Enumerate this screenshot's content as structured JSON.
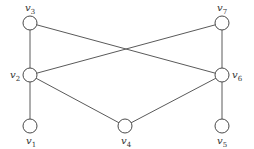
{
  "diagram": {
    "type": "undirected-graph",
    "colors": {
      "edge": "#5a5a5a",
      "node_stroke": "#4a4a4a",
      "node_fill": "#ffffff",
      "label": "#333333"
    },
    "node_radius": 7,
    "nodes": [
      {
        "id": "v1",
        "base": "v",
        "sub": "1",
        "x": 30,
        "y": 126,
        "lx": 26,
        "ly": 144
      },
      {
        "id": "v2",
        "base": "v",
        "sub": "2",
        "x": 30,
        "y": 75,
        "lx": 10,
        "ly": 78
      },
      {
        "id": "v3",
        "base": "v",
        "sub": "3",
        "x": 30,
        "y": 23,
        "lx": 25,
        "ly": 11
      },
      {
        "id": "v4",
        "base": "v",
        "sub": "4",
        "x": 125,
        "y": 126,
        "lx": 121,
        "ly": 144
      },
      {
        "id": "v5",
        "base": "v",
        "sub": "5",
        "x": 222,
        "y": 126,
        "lx": 217,
        "ly": 144
      },
      {
        "id": "v6",
        "base": "v",
        "sub": "6",
        "x": 222,
        "y": 75,
        "lx": 232,
        "ly": 78
      },
      {
        "id": "v7",
        "base": "v",
        "sub": "7",
        "x": 222,
        "y": 23,
        "lx": 217,
        "ly": 11
      }
    ],
    "edges": [
      [
        "v3",
        "v2"
      ],
      [
        "v3",
        "v6"
      ],
      [
        "v7",
        "v2"
      ],
      [
        "v7",
        "v6"
      ],
      [
        "v2",
        "v1"
      ],
      [
        "v2",
        "v4"
      ],
      [
        "v4",
        "v6"
      ],
      [
        "v6",
        "v5"
      ]
    ]
  }
}
